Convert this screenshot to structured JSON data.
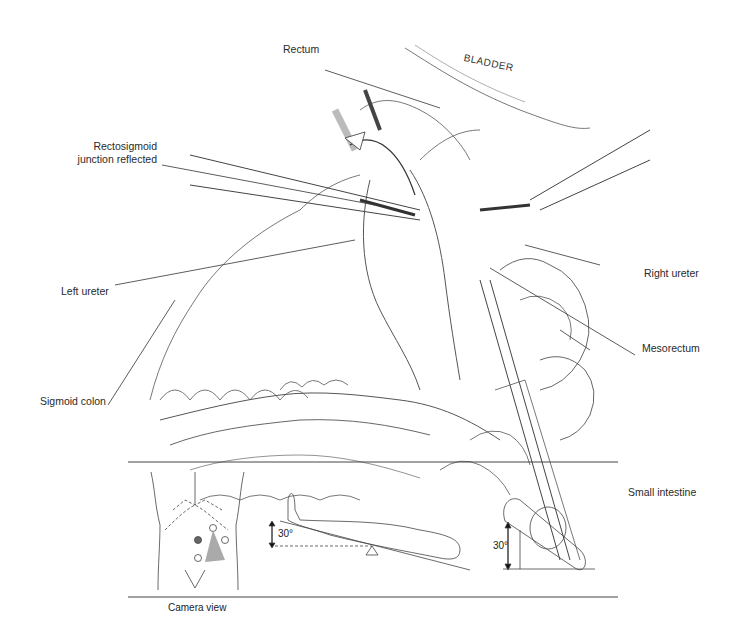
{
  "figure": {
    "main_illustration": {
      "description": "Laparoscopic view of rectosigmoid mobilization",
      "labels": {
        "rectum": "Rectum",
        "bladder": "BLADDER",
        "rectosigmoid_line1": "Rectosigmoid",
        "rectosigmoid_line2": "junction reflected",
        "right_ureter": "Right ureter",
        "mesorectum": "Mesorectum",
        "left_ureter": "Left ureter",
        "small_intestine": "Small intestine",
        "sigmoid_colon": "Sigmoid colon"
      }
    },
    "inset_panel": {
      "camera_view_label": "Camera view",
      "trendelenburg_angle": "30°",
      "tilt_angle": "30°"
    }
  }
}
